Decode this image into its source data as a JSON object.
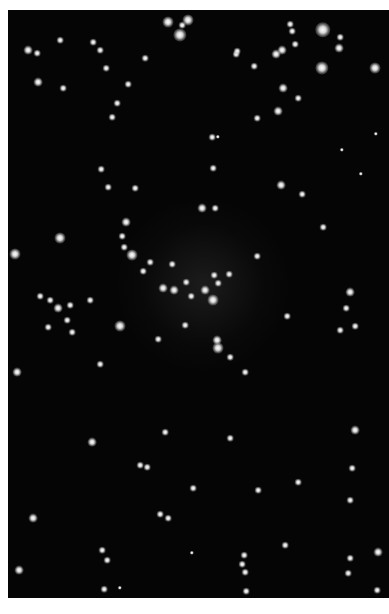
{
  "image": {
    "subject": "star cluster",
    "background_color": "#050505",
    "star_color": "#e0e0e0",
    "stars": [
      [
        28,
        50,
        4
      ],
      [
        37,
        53,
        3
      ],
      [
        60,
        40,
        3
      ],
      [
        93,
        42,
        3
      ],
      [
        100,
        50,
        3
      ],
      [
        106,
        68,
        3
      ],
      [
        38,
        82,
        4
      ],
      [
        63,
        88,
        3
      ],
      [
        145,
        58,
        3
      ],
      [
        180,
        35,
        6
      ],
      [
        168,
        22,
        5
      ],
      [
        182,
        25,
        3
      ],
      [
        188,
        20,
        5
      ],
      [
        128,
        84,
        3
      ],
      [
        117,
        103,
        3
      ],
      [
        112,
        117,
        3
      ],
      [
        236,
        54,
        3
      ],
      [
        237,
        51,
        3
      ],
      [
        276,
        54,
        4
      ],
      [
        282,
        50,
        4
      ],
      [
        323,
        30,
        7
      ],
      [
        340,
        37,
        3
      ],
      [
        339,
        48,
        4
      ],
      [
        322,
        68,
        6
      ],
      [
        375,
        68,
        5
      ],
      [
        290,
        24,
        3
      ],
      [
        292,
        31,
        3
      ],
      [
        295,
        44,
        3
      ],
      [
        254,
        66,
        3
      ],
      [
        283,
        88,
        4
      ],
      [
        298,
        98,
        3
      ],
      [
        278,
        111,
        4
      ],
      [
        257,
        118,
        3
      ],
      [
        376,
        134,
        2
      ],
      [
        342,
        150,
        2
      ],
      [
        361,
        174,
        2
      ],
      [
        212,
        137,
        3
      ],
      [
        218,
        137,
        2
      ],
      [
        213,
        168,
        3
      ],
      [
        101,
        169,
        3
      ],
      [
        108,
        187,
        3
      ],
      [
        135,
        188,
        3
      ],
      [
        281,
        185,
        4
      ],
      [
        302,
        194,
        3
      ],
      [
        323,
        227,
        3
      ],
      [
        202,
        208,
        4
      ],
      [
        215,
        208,
        3
      ],
      [
        126,
        222,
        4
      ],
      [
        122,
        236,
        3
      ],
      [
        124,
        247,
        3
      ],
      [
        132,
        255,
        5
      ],
      [
        150,
        262,
        3
      ],
      [
        143,
        271,
        3
      ],
      [
        172,
        264,
        3
      ],
      [
        186,
        282,
        3
      ],
      [
        163,
        288,
        4
      ],
      [
        174,
        290,
        4
      ],
      [
        191,
        296,
        3
      ],
      [
        205,
        290,
        4
      ],
      [
        214,
        275,
        3
      ],
      [
        218,
        283,
        3
      ],
      [
        229,
        274,
        3
      ],
      [
        213,
        300,
        5
      ],
      [
        120,
        326,
        5
      ],
      [
        185,
        325,
        3
      ],
      [
        158,
        339,
        3
      ],
      [
        217,
        340,
        4
      ],
      [
        218,
        348,
        5
      ],
      [
        230,
        357,
        3
      ],
      [
        257,
        256,
        3
      ],
      [
        60,
        238,
        5
      ],
      [
        15,
        254,
        5
      ],
      [
        40,
        296,
        3
      ],
      [
        50,
        300,
        3
      ],
      [
        58,
        308,
        4
      ],
      [
        70,
        305,
        3
      ],
      [
        67,
        320,
        3
      ],
      [
        48,
        327,
        3
      ],
      [
        72,
        332,
        3
      ],
      [
        90,
        300,
        3
      ],
      [
        350,
        292,
        4
      ],
      [
        355,
        326,
        3
      ],
      [
        340,
        330,
        3
      ],
      [
        346,
        308,
        3
      ],
      [
        17,
        372,
        4
      ],
      [
        100,
        364,
        3
      ],
      [
        245,
        372,
        3
      ],
      [
        287,
        316,
        3
      ],
      [
        92,
        442,
        4
      ],
      [
        147,
        467,
        3
      ],
      [
        140,
        465,
        3
      ],
      [
        165,
        432,
        3
      ],
      [
        230,
        438,
        3
      ],
      [
        258,
        490,
        3
      ],
      [
        193,
        488,
        3
      ],
      [
        298,
        482,
        3
      ],
      [
        355,
        430,
        4
      ],
      [
        352,
        468,
        3
      ],
      [
        350,
        500,
        3
      ],
      [
        33,
        518,
        4
      ],
      [
        19,
        570,
        4
      ],
      [
        102,
        550,
        3
      ],
      [
        107,
        560,
        3
      ],
      [
        104,
        589,
        3
      ],
      [
        120,
        588,
        2
      ],
      [
        160,
        514,
        3
      ],
      [
        168,
        518,
        3
      ],
      [
        244,
        555,
        3
      ],
      [
        242,
        564,
        3
      ],
      [
        245,
        572,
        3
      ],
      [
        246,
        591,
        3
      ],
      [
        285,
        545,
        3
      ],
      [
        350,
        558,
        3
      ],
      [
        348,
        573,
        3
      ],
      [
        377,
        590,
        3
      ],
      [
        378,
        552,
        4
      ],
      [
        192,
        553,
        2
      ]
    ]
  }
}
